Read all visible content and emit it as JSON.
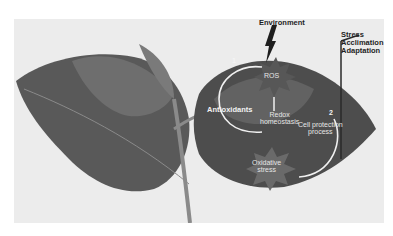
{
  "figure": {
    "labels": {
      "environment": "Environment",
      "outcome": [
        "Stress",
        "Acclimation",
        "Adaptation"
      ],
      "ros": "ROS",
      "antioxidants": "Antioxidants",
      "redox_line1": "Redox",
      "redox_line2": "homeostasis",
      "cell_protection_line1": "Cell protection",
      "cell_protection_line2": "process",
      "oxidative_line1": "Oxidative",
      "oxidative_line2": "stress",
      "step1": "1",
      "step2": "2"
    },
    "colors": {
      "background": "#ffffff",
      "photo_bg": "#ececec",
      "leaf_dark": "#4a4a4a",
      "leaf_mid": "#6a6a6a",
      "arrow_light": "#f0f0f0",
      "label_dark": "#1e1e1e"
    }
  }
}
